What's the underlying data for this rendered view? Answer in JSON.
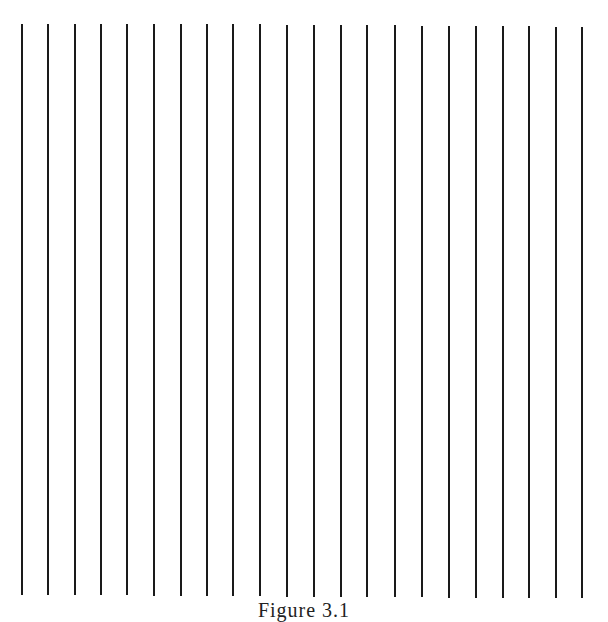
{
  "figure": {
    "line_color": "#1a1a1a",
    "line_count": 22,
    "lines": [
      {
        "x": 22,
        "top": 24,
        "bottom": 595
      },
      {
        "x": 48,
        "top": 24,
        "bottom": 595
      },
      {
        "x": 75,
        "top": 24,
        "bottom": 595
      },
      {
        "x": 101,
        "top": 24,
        "bottom": 595
      },
      {
        "x": 127,
        "top": 24,
        "bottom": 595
      },
      {
        "x": 154,
        "top": 24,
        "bottom": 596
      },
      {
        "x": 181,
        "top": 24,
        "bottom": 596
      },
      {
        "x": 207,
        "top": 24,
        "bottom": 596
      },
      {
        "x": 233,
        "top": 24,
        "bottom": 596
      },
      {
        "x": 260,
        "top": 24,
        "bottom": 596
      },
      {
        "x": 287,
        "top": 25,
        "bottom": 597
      },
      {
        "x": 314,
        "top": 25,
        "bottom": 597
      },
      {
        "x": 341,
        "top": 25,
        "bottom": 597
      },
      {
        "x": 367,
        "top": 25,
        "bottom": 597
      },
      {
        "x": 395,
        "top": 25,
        "bottom": 597
      },
      {
        "x": 422,
        "top": 26,
        "bottom": 597
      },
      {
        "x": 449,
        "top": 26,
        "bottom": 598
      },
      {
        "x": 476,
        "top": 26,
        "bottom": 598
      },
      {
        "x": 503,
        "top": 26,
        "bottom": 598
      },
      {
        "x": 529,
        "top": 26,
        "bottom": 598
      },
      {
        "x": 556,
        "top": 27,
        "bottom": 598
      },
      {
        "x": 582,
        "top": 27,
        "bottom": 598
      }
    ],
    "caption": "Figure 3.1"
  }
}
